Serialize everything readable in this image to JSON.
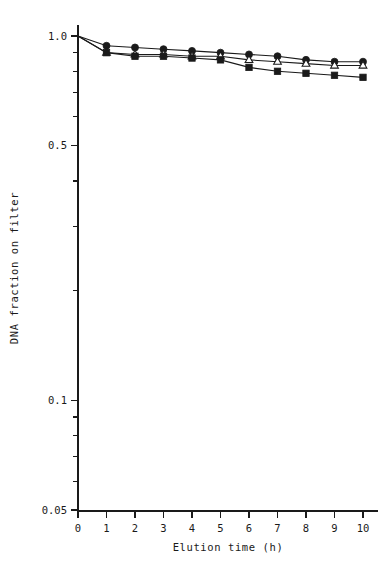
{
  "figure": {
    "background": "#ffffff",
    "ink_color": "#1a1a1a",
    "y_axis_title": "DNA fraction on filter",
    "x_axis_title": "Elution time  (h)"
  },
  "axes": {
    "x_tick_labels": [
      "0",
      "1",
      "2",
      "3",
      "4",
      "5",
      "6",
      "7",
      "8",
      "9",
      "10"
    ],
    "y_tick_labels": [
      "1.0",
      "0.5",
      "0.1",
      "0.05"
    ]
  },
  "chart_data": {
    "type": "line",
    "title": "",
    "subtitle": "",
    "xlabel": "Elution time  (h)",
    "ylabel": "DNA fraction on filter",
    "xscale": "linear",
    "yscale": "log",
    "xlim": [
      0,
      10
    ],
    "ylim": [
      0.05,
      1.0
    ],
    "xticks": [
      0,
      1,
      2,
      3,
      4,
      5,
      6,
      7,
      8,
      9,
      10
    ],
    "yticks": [
      1.0,
      0.5,
      0.1,
      0.05
    ],
    "y_minor_ticks": [
      0.9,
      0.8,
      0.7,
      0.6,
      0.4,
      0.3,
      0.2,
      0.09,
      0.08,
      0.07,
      0.06
    ],
    "grid": false,
    "legend": false,
    "legend_position": "none",
    "x": [
      0,
      1,
      2,
      3,
      4,
      5,
      6,
      7,
      8,
      9,
      10
    ],
    "series": [
      {
        "name": "filled-circle",
        "marker": "circle",
        "marker_fill": "solid",
        "values": [
          1.0,
          0.94,
          0.93,
          0.92,
          0.91,
          0.9,
          0.89,
          0.88,
          0.86,
          0.85,
          0.85
        ]
      },
      {
        "name": "open-triangle",
        "marker": "triangle",
        "marker_fill": "open",
        "values": [
          1.0,
          0.9,
          0.89,
          0.89,
          0.88,
          0.88,
          0.86,
          0.85,
          0.84,
          0.83,
          0.83
        ]
      },
      {
        "name": "filled-square",
        "marker": "square",
        "marker_fill": "solid",
        "values": [
          1.0,
          0.9,
          0.88,
          0.88,
          0.87,
          0.86,
          0.82,
          0.8,
          0.79,
          0.78,
          0.77
        ]
      }
    ]
  }
}
